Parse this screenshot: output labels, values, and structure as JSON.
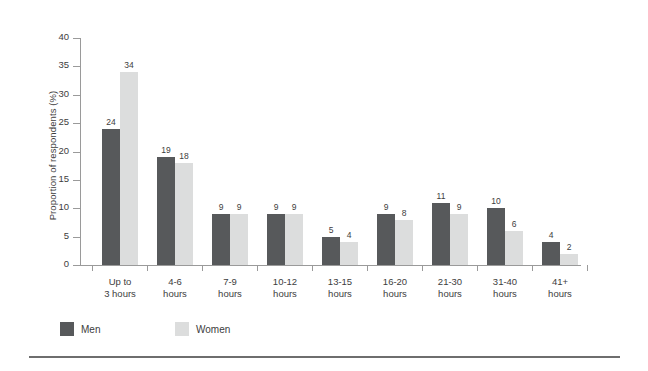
{
  "chart_data": {
    "type": "bar",
    "title": "",
    "xlabel": "",
    "ylabel": "Proportion of respondents (%)",
    "ylim": [
      0,
      40
    ],
    "yticks": [
      0,
      5,
      10,
      15,
      20,
      25,
      30,
      35,
      40
    ],
    "ytick_labels": [
      "0",
      "5",
      "10",
      "15",
      "20",
      "25",
      "30",
      "35",
      "40"
    ],
    "grid": false,
    "legend_position": "bottom-left",
    "categories": [
      "Up to 3 hours",
      "4-6 hours",
      "7-9 hours",
      "10-12 hours",
      "13-15 hours",
      "16-20 hours",
      "21-30 hours",
      "31-40 hours",
      "41+ hours"
    ],
    "category_lines": [
      [
        "Up to",
        "3 hours"
      ],
      [
        "4-6",
        "hours"
      ],
      [
        "7-9",
        "hours"
      ],
      [
        "10-12",
        "hours"
      ],
      [
        "13-15",
        "hours"
      ],
      [
        "16-20",
        "hours"
      ],
      [
        "21-30",
        "hours"
      ],
      [
        "31-40",
        "hours"
      ],
      [
        "41+",
        "hours"
      ]
    ],
    "series": [
      {
        "name": "Men",
        "color": "#57595b",
        "values": [
          24,
          19,
          9,
          9,
          5,
          9,
          11,
          10,
          4
        ],
        "labels": [
          "24",
          "19",
          "9",
          "9",
          "5",
          "9",
          "11",
          "10",
          "4"
        ]
      },
      {
        "name": "Women",
        "color": "#dcdddd",
        "values": [
          34,
          18,
          9,
          9,
          4,
          8,
          9,
          6,
          2
        ],
        "labels": [
          "34",
          "18",
          "9",
          "9",
          "4",
          "8",
          "9",
          "6",
          "2"
        ]
      }
    ]
  }
}
